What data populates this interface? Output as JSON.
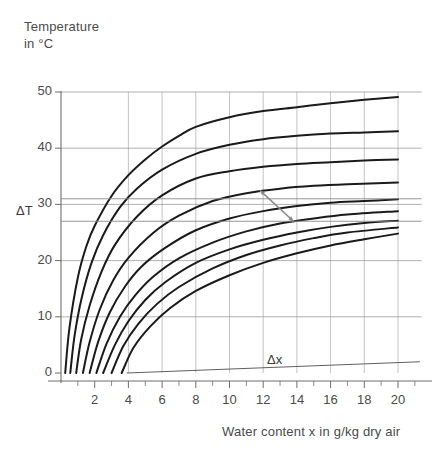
{
  "axes": {
    "y_title": "Temperature\nin °C",
    "x_title": "Water content x in g/kg dry air",
    "delta_t_label": "ΔT",
    "delta_x_label": "Δx",
    "y_ticks": [
      "0",
      "10",
      "20",
      "30",
      "40",
      "50"
    ],
    "x_ticks": [
      "2",
      "4",
      "6",
      "8",
      "10",
      "12",
      "14",
      "16",
      "18",
      "20"
    ]
  },
  "colors": {
    "curve": "#1a1a1a",
    "grid": "#9a9a9a",
    "axis": "#6e6e6e",
    "text": "#4a4a4a",
    "annotation": "#8a8a8a"
  },
  "chart_data": {
    "type": "line",
    "title": "",
    "xlabel": "Water content x in g/kg dry air",
    "ylabel": "Temperature in °C",
    "xlim": [
      0,
      21.5
    ],
    "ylim": [
      -2,
      52
    ],
    "grid": true,
    "legend": "none",
    "x_major_step": 2,
    "x_minor_step": 1,
    "y_major_step": 10,
    "series": [
      {
        "name": "curve-1",
        "x": [
          0.25,
          0.5,
          1,
          1.5,
          2,
          3,
          4,
          5,
          6,
          7,
          8,
          10,
          12,
          14,
          16,
          18,
          20
        ],
        "y": [
          0,
          8.0,
          17.0,
          22.5,
          26.2,
          31.5,
          35.2,
          38.0,
          40.3,
          42.2,
          43.8,
          45.5,
          46.6,
          47.3,
          48.0,
          48.6,
          49.1
        ]
      },
      {
        "name": "curve-2",
        "x": [
          0.55,
          0.8,
          1.2,
          1.8,
          2.5,
          3.5,
          4.5,
          6,
          8,
          10,
          12,
          14,
          16,
          18,
          20
        ],
        "y": [
          0,
          6.5,
          13.0,
          19.5,
          24.5,
          29.5,
          32.8,
          36.2,
          39.0,
          40.6,
          41.6,
          42.2,
          42.6,
          42.8,
          43.0
        ]
      },
      {
        "name": "curve-3",
        "x": [
          0.9,
          1.2,
          1.7,
          2.4,
          3.2,
          4.5,
          6,
          8,
          10,
          12,
          14,
          16,
          18,
          20
        ],
        "y": [
          0,
          6.0,
          12.0,
          18.0,
          22.8,
          27.8,
          31.6,
          34.6,
          35.9,
          36.7,
          37.2,
          37.5,
          37.8,
          38.0
        ]
      },
      {
        "name": "curve-4",
        "x": [
          1.3,
          1.7,
          2.3,
          3.1,
          4.0,
          5.5,
          7,
          9,
          11,
          13,
          15,
          17,
          20
        ],
        "y": [
          0,
          5.5,
          11.3,
          16.5,
          20.5,
          25.0,
          28.0,
          30.6,
          32.0,
          32.8,
          33.3,
          33.6,
          33.9
        ]
      },
      {
        "name": "curve-5",
        "x": [
          1.7,
          2.2,
          2.9,
          3.8,
          4.8,
          6.2,
          8,
          10,
          12,
          14,
          16,
          18,
          20
        ],
        "y": [
          0,
          5.5,
          10.8,
          15.4,
          19.0,
          22.3,
          25.4,
          27.5,
          28.8,
          29.7,
          30.3,
          30.6,
          30.9
        ]
      },
      {
        "name": "curve-6",
        "x": [
          2.1,
          2.7,
          3.5,
          4.4,
          5.5,
          7,
          9,
          11,
          13,
          15,
          17,
          20
        ],
        "y": [
          0,
          5.2,
          10.0,
          13.8,
          17.2,
          20.4,
          23.2,
          25.2,
          26.6,
          27.5,
          28.2,
          28.8
        ]
      },
      {
        "name": "curve-7",
        "x": [
          2.5,
          3.2,
          4.0,
          5.0,
          6.2,
          8,
          10,
          12,
          14,
          16,
          18,
          20
        ],
        "y": [
          0,
          5.0,
          9.2,
          13.0,
          16.2,
          19.6,
          22.0,
          23.7,
          25.0,
          26.0,
          26.7,
          27.1
        ]
      },
      {
        "name": "curve-8",
        "x": [
          3.0,
          3.7,
          4.6,
          5.7,
          7,
          9,
          11,
          13,
          15,
          17,
          20
        ],
        "y": [
          0,
          4.8,
          8.8,
          12.3,
          15.3,
          18.6,
          21.0,
          22.7,
          24.0,
          25.0,
          25.9
        ]
      },
      {
        "name": "curve-9",
        "x": [
          3.6,
          4.3,
          5.3,
          6.5,
          8,
          10,
          12,
          14,
          16,
          18,
          20
        ],
        "y": [
          0,
          4.5,
          8.3,
          11.6,
          14.6,
          17.4,
          19.6,
          21.3,
          22.7,
          23.8,
          24.8
        ]
      }
    ],
    "annotations": {
      "arrow": {
        "label": "Δx",
        "from": {
          "x": 11.8,
          "y": 32.5
        },
        "to": {
          "x": 13.8,
          "y": 27.0
        }
      },
      "reference_lines": [
        {
          "name": "upper-delta-line",
          "y": 31.0
        },
        {
          "name": "lower-delta-line",
          "y": 27.0
        }
      ],
      "baseline_slope_line": {
        "name": "x-axis-slope-line",
        "from": {
          "x": 3.9,
          "y": 0.0
        },
        "to": {
          "x": 21.3,
          "y": 2.0
        }
      }
    }
  }
}
